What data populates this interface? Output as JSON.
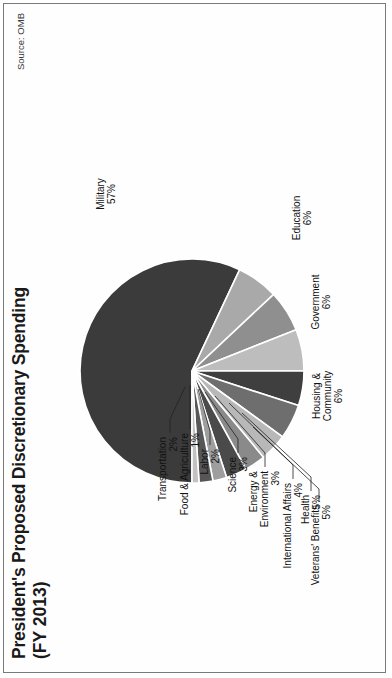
{
  "figure": {
    "title": "President's Proposed Discretionary Spending",
    "subtitle": "(FY 2013)",
    "source": "Source: OMB",
    "frame_color": "#7a7a7a",
    "background": "#ffffff"
  },
  "chart_data": {
    "type": "pie",
    "title": "President's Proposed Discretionary Spending (FY 2013)",
    "subtitle": "(FY 2013)",
    "unit": "percent",
    "legend_position": "none",
    "labels_style": "callout-leader-lines",
    "total": 100,
    "categories": [
      "Military",
      "Education",
      "Government",
      "Housing & Community",
      "Veterans' Benefits",
      "Health",
      "International Affairs",
      "Energy & Environment",
      "Science",
      "Labor",
      "Transportation",
      "Food & Agriculture"
    ],
    "values": [
      57,
      6,
      6,
      6,
      5,
      5,
      4,
      3,
      3,
      2,
      2,
      1
    ],
    "value_labels": [
      "57%",
      "6%",
      "6%",
      "6%",
      "5%",
      "5%",
      "4%",
      "3%",
      "3%",
      "2%",
      "2%",
      "1%"
    ],
    "slice_colors": [
      "#3b3b3b",
      "#a9a9a9",
      "#8f8f8f",
      "#bdbdbd",
      "#3f3f3f",
      "#6e6e6e",
      "#b8b8b8",
      "#8a8a8a",
      "#4a4a4a",
      "#9e9e9e",
      "#565656",
      "#c2c2c2"
    ],
    "slices": [
      {
        "name": "Military",
        "value": 57,
        "label": "Military",
        "pct_text": "57%",
        "color": "#3b3b3b"
      },
      {
        "name": "Education",
        "value": 6,
        "label": "Education",
        "pct_text": "6%",
        "color": "#a9a9a9"
      },
      {
        "name": "Government",
        "value": 6,
        "label": "Government",
        "pct_text": "6%",
        "color": "#8f8f8f"
      },
      {
        "name": "Housing & Community",
        "value": 6,
        "label": "Housing &\nCommunity",
        "pct_text": "6%",
        "color": "#bdbdbd"
      },
      {
        "name": "Veterans' Benefits",
        "value": 5,
        "label": "Veterans' Benefits",
        "pct_text": "5%",
        "color": "#3f3f3f"
      },
      {
        "name": "Health",
        "value": 5,
        "label": "Health",
        "pct_text": "5%",
        "color": "#6e6e6e"
      },
      {
        "name": "International Affairs",
        "value": 4,
        "label": "International Affairs",
        "pct_text": "4%",
        "color": "#b8b8b8"
      },
      {
        "name": "Energy & Environment",
        "value": 3,
        "label": "Energy &\nEnvironment",
        "pct_text": "3%",
        "color": "#8a8a8a"
      },
      {
        "name": "Science",
        "value": 3,
        "label": "Science",
        "pct_text": "3%",
        "color": "#4a4a4a"
      },
      {
        "name": "Labor",
        "value": 2,
        "label": "Labor",
        "pct_text": "2%",
        "color": "#9e9e9e"
      },
      {
        "name": "Transportation",
        "value": 2,
        "label": "Transportation",
        "pct_text": "2%",
        "color": "#565656"
      },
      {
        "name": "Food & Agriculture",
        "value": 1,
        "label": "Food & Agriculture",
        "pct_text": "1%",
        "color": "#c2c2c2"
      }
    ]
  },
  "callouts": {
    "military": {
      "label": "Military",
      "pct": "57%"
    },
    "education": {
      "label": "Education",
      "pct": "6%"
    },
    "government": {
      "label": "Government",
      "pct": "6%"
    },
    "housing_l1": {
      "label": "Housing &"
    },
    "housing_l2": {
      "label": "Community",
      "pct": "6%"
    },
    "veterans": {
      "label": "Veterans' Benefits",
      "pct": "5%"
    },
    "health": {
      "label": "Health",
      "pct": "5%"
    },
    "intl": {
      "label": "International Affairs",
      "pct": "4%"
    },
    "energy_l1": {
      "label": "Energy &"
    },
    "energy_l2": {
      "label": "Environment",
      "pct": "3%"
    },
    "science": {
      "label": "Science",
      "pct": "3%"
    },
    "labor": {
      "label": "Labor",
      "pct": "2%"
    },
    "transportation": {
      "label": "Transportation",
      "pct": "2%"
    },
    "food": {
      "label": "Food & Agriculture",
      "pct": "1%"
    }
  }
}
